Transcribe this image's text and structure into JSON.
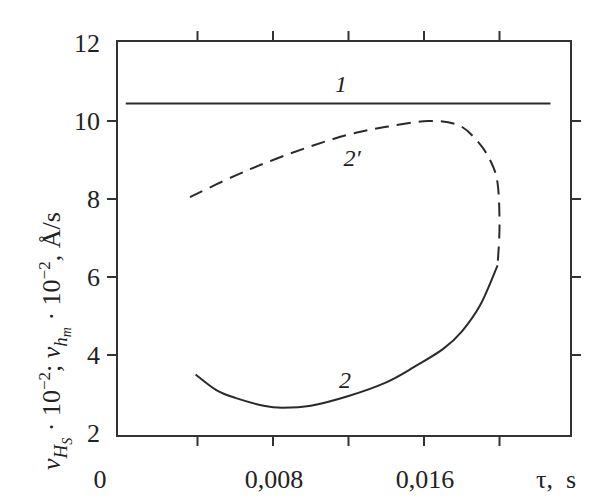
{
  "chart_data": {
    "type": "line",
    "title": "",
    "xlabel": "τ, s",
    "ylabel": "v_Hs · 10^-2; v_hm · 10^-2, Å/s",
    "xlim": [
      0,
      0.0238
    ],
    "ylim": [
      2,
      12
    ],
    "x_ticks": [
      0.004,
      0.008,
      0.012,
      0.016,
      0.02
    ],
    "x_tick_labels": [
      "0",
      "0,008",
      "0,016",
      "τ, s"
    ],
    "y_ticks": [
      2,
      4,
      6,
      8,
      10,
      12
    ],
    "y_tick_labels": [
      "2",
      "4",
      "6",
      "8",
      "10",
      "12"
    ],
    "grid": false,
    "legend": "inline curve labels",
    "series": [
      {
        "name": "1",
        "style": "solid",
        "x": [
          0.0002,
          0.0227
        ],
        "y": [
          10.45,
          10.45
        ]
      },
      {
        "name": "2",
        "style": "solid",
        "x": [
          0.0039,
          0.005,
          0.006,
          0.0075,
          0.0085,
          0.01,
          0.012,
          0.014,
          0.0155,
          0.017,
          0.018,
          0.019,
          0.0199
        ],
        "y": [
          3.5,
          3.1,
          2.9,
          2.7,
          2.65,
          2.7,
          2.95,
          3.3,
          3.7,
          4.15,
          4.6,
          5.3,
          6.3
        ]
      },
      {
        "name": "2'",
        "style": "dashed",
        "x": [
          0.0036,
          0.006,
          0.008,
          0.01,
          0.012,
          0.014,
          0.0162,
          0.0178,
          0.0188,
          0.0195,
          0.0199,
          0.02,
          0.0199
        ],
        "y": [
          8.05,
          8.6,
          9.0,
          9.35,
          9.65,
          9.85,
          10.0,
          9.9,
          9.5,
          9.0,
          8.4,
          7.3,
          6.3
        ]
      }
    ],
    "annotations": [
      {
        "text": "1",
        "x": 0.0115,
        "y": 10.9
      },
      {
        "text": "2'",
        "x": 0.0123,
        "y": 8.7
      },
      {
        "text": "2",
        "x": 0.0117,
        "y": 2.95
      }
    ]
  },
  "axes": {
    "y_title_parts": {
      "main1": "v",
      "sub1": "H",
      "subsub1": "S",
      "mid1": " · 10",
      "sup1": "−2",
      "sep": "; ",
      "main2": "v",
      "sub2": "h",
      "subsub2": "m",
      "mid2": " · 10",
      "sup2": "−2",
      "units": ", Å/s"
    },
    "x_title": "τ,  s",
    "x_origin_label": "0",
    "x_label_008": "0,008",
    "x_label_016": "0,016"
  },
  "labels": {
    "curve1": "1",
    "curve2": "2",
    "curve2p": "2′"
  }
}
